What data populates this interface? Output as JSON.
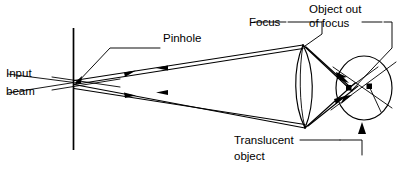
{
  "figure": {
    "background_color": "#ffffff",
    "line_color": "#000000",
    "width": 406,
    "height": 180
  },
  "labels": {
    "input_beam_line1": "Input",
    "input_beam_line2": "beam",
    "pinhole": "Pinhole",
    "focus": "Focus",
    "object_out_of_focus_line1": "Object out",
    "object_out_of_focus_line2": "of focus",
    "translucent_object_line1": "Translucent",
    "translucent_object_line2": "object"
  },
  "components": {
    "barrier": {
      "name": "opaque-screen-with-pinhole",
      "x": 73,
      "y_top": 28,
      "y_bottom": 150
    },
    "pinhole_point": {
      "x": 74,
      "y": 82
    },
    "lens": {
      "name": "translucent-object-lens",
      "x_left": 297,
      "x_right": 311,
      "y_top": 45,
      "y_bottom": 128
    },
    "focus_apex_top": {
      "x": 303,
      "y": 45
    },
    "focus_apex_bottom": {
      "x": 305,
      "y": 128
    },
    "blur_circle": {
      "name": "object-out-of-focus-region",
      "cx": 364,
      "cy": 88,
      "rx": 28,
      "ry": 32
    },
    "scatter_points": [
      {
        "x": 349,
        "y": 88
      },
      {
        "x": 369,
        "y": 86
      }
    ]
  },
  "ray_arrows": {
    "diverging_right_count": 2,
    "converging_left_count": 2,
    "note": "Double-line ray bundles with solid triangular arrowheads"
  }
}
